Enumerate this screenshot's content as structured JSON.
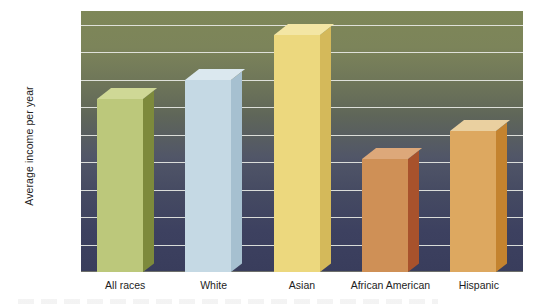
{
  "chart_data": {
    "type": "bar",
    "title": "",
    "xlabel": "",
    "ylabel": "Average income per year",
    "categories": [
      "All races",
      "White",
      "Asian",
      "African American",
      "Hispanic"
    ],
    "values": [
      63000,
      70000,
      86400,
      41000,
      51400
    ],
    "series": [
      {
        "name": "Average income per year",
        "values": [
          63000,
          70000,
          86400,
          41000,
          51400
        ]
      }
    ],
    "ylim": [
      0,
      95000
    ],
    "ytick_labels": [
      "$0",
      "$10,000",
      "$20,000",
      "$30,000",
      "$40,000",
      "$50,000",
      "$60,000",
      "$70,000",
      "$80,000",
      "$90,000"
    ],
    "ytick_values": [
      0,
      10000,
      20000,
      30000,
      40000,
      50000,
      60000,
      70000,
      80000,
      90000
    ],
    "grid": true,
    "legend": "none",
    "bar_colors": [
      "#bcc87b",
      "#c5d9e4",
      "#ecd87e",
      "#cf9056",
      "#dda860"
    ],
    "bar_side_colors": [
      "#7d8a3c",
      "#a6c0d0",
      "#d4b95a",
      "#a8522c",
      "#c4832f"
    ],
    "bar_top_colors": [
      "#cfd896",
      "#dbe8ef",
      "#f3e6a4",
      "#dda87a",
      "#ead0a0"
    ],
    "background_top_color": "#7e8758",
    "background_bottom_color": "#393d5c",
    "gridline_color": "#e7e9e4"
  },
  "axis": {
    "y_title": "Average income per year"
  }
}
